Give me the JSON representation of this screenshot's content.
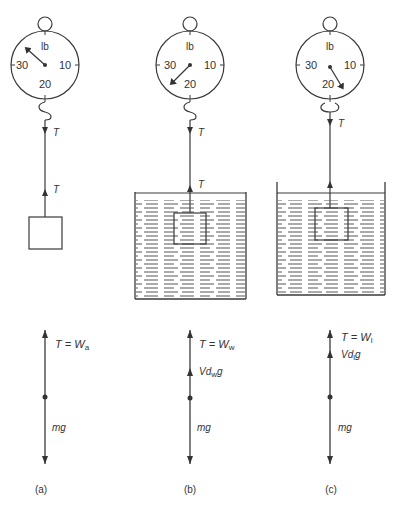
{
  "figure": {
    "panels": [
      {
        "id": "a",
        "caption": "(a)",
        "scale": {
          "unit": "lb",
          "tick_30": "30",
          "tick_10": "10",
          "tick_20": "20",
          "needle_points_to": "between 30 and lb (upper-left)"
        },
        "tension_top": "T",
        "tension_bottom": "T",
        "medium": "air",
        "fbd": {
          "top_force": "T = W",
          "top_sub": "a",
          "buoyancy": null,
          "buoyancy_sub": null,
          "weight": "mg"
        }
      },
      {
        "id": "b",
        "caption": "(b)",
        "scale": {
          "unit": "lb",
          "tick_30": "30",
          "tick_10": "10",
          "tick_20": "20",
          "needle_points_to": "between 30 and 20 (lower-left)"
        },
        "tension_top": "T",
        "tension_bottom": "T",
        "medium": "water",
        "fbd": {
          "top_force": "T = W",
          "top_sub": "w",
          "buoyancy_pre": "Vd",
          "buoyancy_sub": "w",
          "buoyancy_post": "g",
          "weight": "mg"
        }
      },
      {
        "id": "c",
        "caption": "(c)",
        "scale": {
          "unit": "lb",
          "tick_30": "30",
          "tick_10": "10",
          "tick_20": "20",
          "needle_points_to": "between 20 and 10 (lower-right)"
        },
        "tension_top": "T",
        "tension_bottom": null,
        "medium": "liquid",
        "fbd": {
          "top_force": "T = W",
          "top_sub": "l",
          "buoyancy_pre": "Vd",
          "buoyancy_sub": "l",
          "buoyancy_post": "g",
          "weight": "mg"
        }
      }
    ]
  }
}
